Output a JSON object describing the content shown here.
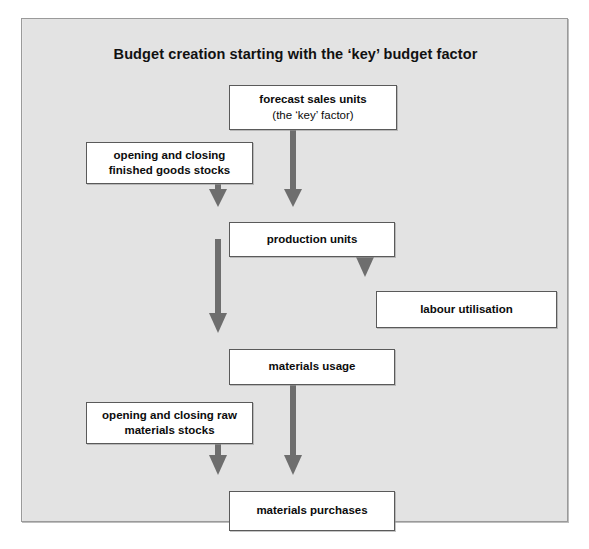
{
  "diagram": {
    "title": "Budget creation starting with the ‘key’ budget factor",
    "panel_background": "#e3e3e3",
    "node_fill": "#ffffff",
    "node_border": "#5a5a5a",
    "arrow_color": "#6e6e6e",
    "nodes": [
      {
        "id": "forecast-sales",
        "lines": [
          "forecast sales units",
          "(the ‘key’ factor)"
        ],
        "line1": "forecast sales units",
        "line2": "(the ‘key’ factor)"
      },
      {
        "id": "finished-stocks",
        "lines": [
          "opening and closing",
          "finished goods stocks"
        ],
        "line1": "opening and closing",
        "line2": "finished goods stocks"
      },
      {
        "id": "production-units",
        "lines": [
          "production units"
        ],
        "line1": "production units"
      },
      {
        "id": "labour-utilisation",
        "lines": [
          "labour utilisation"
        ],
        "line1": "labour utilisation"
      },
      {
        "id": "materials-usage",
        "lines": [
          "materials usage"
        ],
        "line1": "materials usage"
      },
      {
        "id": "raw-stocks",
        "lines": [
          "opening and closing raw",
          "materials stocks"
        ],
        "line1": "opening and closing raw",
        "line2": "materials stocks"
      },
      {
        "id": "materials-purchases",
        "lines": [
          "materials purchases"
        ],
        "line1": "materials purchases"
      }
    ],
    "connections": [
      {
        "from": "forecast-sales",
        "to": "production-units"
      },
      {
        "from": "finished-stocks",
        "to": "production-units"
      },
      {
        "from": "production-units",
        "to": "materials-usage"
      },
      {
        "from": "production-units",
        "to": "labour-utilisation"
      },
      {
        "from": "materials-usage",
        "to": "materials-purchases"
      },
      {
        "from": "raw-stocks",
        "to": "materials-purchases"
      }
    ]
  }
}
